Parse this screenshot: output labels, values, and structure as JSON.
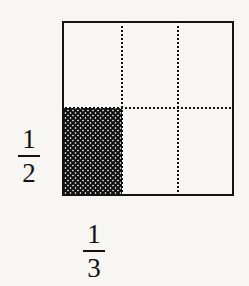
{
  "figure": {
    "type": "fraction-area-model",
    "unit_square": {
      "x": 62,
      "y": 21,
      "width": 172,
      "height": 175,
      "stroke_color": "#141414",
      "stroke_width": 2
    },
    "partitions": {
      "vertical": {
        "count": 3,
        "line_style": "dotted",
        "color": "#111111",
        "positions_px": [
          121,
          177
        ]
      },
      "horizontal": {
        "count": 2,
        "line_style": "dotted",
        "color": "#111111",
        "positions_px": [
          107
        ]
      }
    },
    "shaded_region": {
      "name": "cross-hatched-cell",
      "fill_pattern": "cross-hatch",
      "pattern_color": "#111111",
      "column_index": 1,
      "row_index": 2,
      "fraction_of_square": "1/6",
      "x": 63,
      "y": 108,
      "width": 59,
      "height": 87
    },
    "labels": {
      "vertical": {
        "name": "one-half",
        "numerator": "1",
        "denominator": "2"
      },
      "horizontal": {
        "name": "one-third",
        "numerator": "1",
        "denominator": "3"
      }
    },
    "background_color": "#f7f6f3"
  }
}
